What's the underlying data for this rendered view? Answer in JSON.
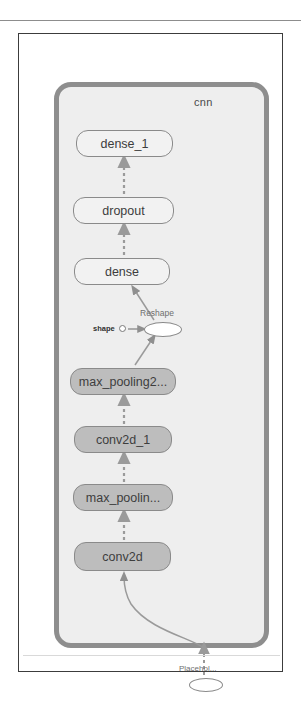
{
  "figure": {
    "container_label": "cnn",
    "accent_border": "#8e8e8e",
    "container_fill": "#eeeeee",
    "node_fill_light": "#f2f2f2",
    "node_fill_dark": "#bdbdbd",
    "edge_color": "#9a9a9a"
  },
  "graph": {
    "type": "diagram",
    "orientation": "bottom-to-top dataflow",
    "nodes": [
      {
        "id": "dense_1",
        "label": "dense_1",
        "kind": "layer-block",
        "fill": "light",
        "x": 57,
        "y": 96,
        "w": 97,
        "h": 27
      },
      {
        "id": "dropout",
        "label": "dropout",
        "kind": "layer-block",
        "fill": "light",
        "x": 54,
        "y": 163,
        "w": 101,
        "h": 27
      },
      {
        "id": "dense",
        "label": "dense",
        "kind": "layer-block",
        "fill": "light",
        "x": 55,
        "y": 224,
        "w": 96,
        "h": 27
      },
      {
        "id": "reshape",
        "label": "Reshape",
        "kind": "op-ellipse",
        "fill": "white",
        "x": 125,
        "y": 288,
        "w": 38,
        "h": 15
      },
      {
        "id": "shape",
        "label": "shape",
        "kind": "input-port",
        "fill": "white",
        "x": 100,
        "y": 291,
        "w": 7,
        "h": 7
      },
      {
        "id": "max_pooling2d_1",
        "label": "max_pooling2...",
        "kind": "layer-block",
        "fill": "dark",
        "x": 51,
        "y": 334,
        "w": 106,
        "h": 27
      },
      {
        "id": "conv2d_1",
        "label": "conv2d_1",
        "kind": "layer-block",
        "fill": "dark",
        "x": 55,
        "y": 392,
        "w": 98,
        "h": 27
      },
      {
        "id": "max_pooling2d",
        "label": "max_poolin...",
        "kind": "layer-block",
        "fill": "dark",
        "x": 54,
        "y": 450,
        "w": 100,
        "h": 27
      },
      {
        "id": "conv2d",
        "label": "conv2d",
        "kind": "layer-block",
        "fill": "dark",
        "x": 55,
        "y": 508,
        "w": 97,
        "h": 29
      },
      {
        "id": "placeholder",
        "label": "Placehol...",
        "kind": "op-ellipse",
        "fill": "white",
        "x": 170,
        "y": 644,
        "w": 34,
        "h": 14
      }
    ],
    "edges": [
      {
        "from": "dropout",
        "to": "dense_1",
        "style": "dashed"
      },
      {
        "from": "dense",
        "to": "dropout",
        "style": "dashed"
      },
      {
        "from": "reshape",
        "to": "dense",
        "style": "solid"
      },
      {
        "from": "shape",
        "to": "reshape",
        "style": "solid"
      },
      {
        "from": "max_pooling2d_1",
        "to": "reshape",
        "style": "solid"
      },
      {
        "from": "conv2d_1",
        "to": "max_pooling2d_1",
        "style": "dashed"
      },
      {
        "from": "max_pooling2d",
        "to": "conv2d_1",
        "style": "dashed"
      },
      {
        "from": "conv2d",
        "to": "max_pooling2d",
        "style": "dashed"
      },
      {
        "from": "placeholder",
        "to": "conv2d",
        "style": "curved"
      }
    ]
  }
}
